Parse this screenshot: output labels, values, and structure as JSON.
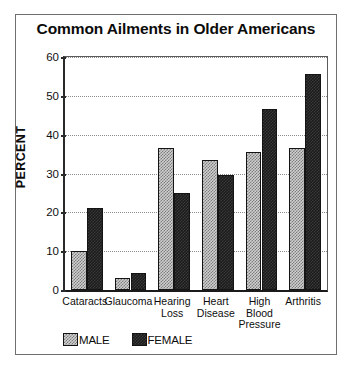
{
  "chart_data": {
    "type": "bar",
    "title": "Common Ailments in Older Americans",
    "xlabel": "",
    "ylabel": "PERCENT",
    "ylim": [
      0,
      60
    ],
    "yticks": [
      0,
      10,
      20,
      30,
      40,
      50,
      60
    ],
    "grid": true,
    "legend_position": "bottom-left",
    "categories": [
      "Cataracts",
      "Glaucoma",
      "Hearing Loss",
      "Heart Disease",
      "High Blood Pressure",
      "Arthritis"
    ],
    "category_lines": [
      [
        "Cataracts"
      ],
      [
        "Glaucoma"
      ],
      [
        "Hearing",
        "Loss"
      ],
      [
        "Heart",
        "Disease"
      ],
      [
        "High",
        "Blood",
        "Pressure"
      ],
      [
        "Arthritis"
      ]
    ],
    "series": [
      {
        "name": "MALE",
        "color": "#cfcfcf",
        "values": [
          10,
          3,
          36.5,
          33.5,
          35.5,
          36.5
        ]
      },
      {
        "name": "FEMALE",
        "color": "#1b1b1b",
        "values": [
          21,
          4.5,
          25,
          29.5,
          46.5,
          55.5
        ]
      }
    ]
  },
  "legend": {
    "male_label": "MALE",
    "female_label": "FEMALE"
  }
}
